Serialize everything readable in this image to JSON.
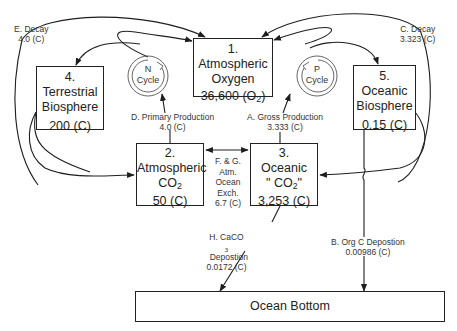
{
  "boxes": {
    "atm_oxygen": {
      "num": "1.",
      "name1": "Atmospheric",
      "name2": "Oxygen",
      "value": "36,600",
      "unit_prefix": "(O",
      "unit_sub": "2",
      "unit_suffix": ")"
    },
    "atm_co2": {
      "num": "2.",
      "name1": "Atmospheric",
      "name2_main": "CO",
      "name2_sub": "2",
      "value": "50 (C)"
    },
    "oceanic_co2": {
      "num": "3.",
      "name1": "Oceanic",
      "name2_main": "\" CO",
      "name2_sub": "2",
      "name2_suffix": "\"",
      "value": "3,253 (C)"
    },
    "terrestrial": {
      "num": "4.",
      "name1": "Terrestrial",
      "name2": "Biosphere",
      "value": "200 (C)"
    },
    "oceanic_bio": {
      "num": "5.",
      "name1": "Oceanic",
      "name2": "Biosphere",
      "value": "0.15 (C)"
    },
    "ocean_bottom": {
      "name": "Ocean Bottom"
    }
  },
  "cycles": {
    "n": {
      "letter": "N",
      "word": "Cycle"
    },
    "p": {
      "letter": "P",
      "word": "Cycle"
    }
  },
  "flows": {
    "A": {
      "label": "A. Gross Production",
      "value": "3.333 (C)"
    },
    "B": {
      "label": "B. Org C Depostion",
      "value": "0.00986 (C)"
    },
    "C": {
      "label": "C. Decay",
      "value": "3.323 (C)"
    },
    "D": {
      "label": "D. Primary Production",
      "value": "4.0 (C)"
    },
    "E": {
      "label": "E. Decay",
      "value": "4.0 (C)"
    },
    "FG": {
      "line1": "F. & G.",
      "line2": "Atm.",
      "line3": "Ocean",
      "line4": "Exch.",
      "value": "6.7 (C)"
    },
    "H": {
      "label_prefix": "H. CaCO",
      "label_sub": "3",
      "label_suffix": "  Depostion",
      "value": "0.0172 (C)"
    }
  },
  "colors": {
    "line": "#1e1e1e",
    "text": "#222222",
    "background": "#ffffff"
  }
}
